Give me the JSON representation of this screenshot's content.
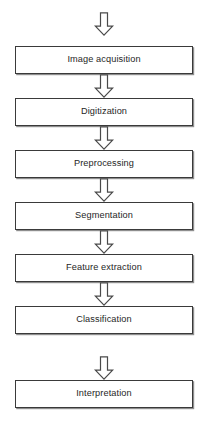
{
  "diagram": {
    "type": "flowchart",
    "orientation": "vertical",
    "title": "",
    "background_color": "#ffffff",
    "box_border_color": "#3a3a3a",
    "box_fill_color": "#ffffff",
    "box_shadow_color": "#8e8e8e",
    "text_color": "#262626",
    "arrow_style": "open-block-arrow",
    "arrow_fill_color": "#ffffff",
    "arrow_border_color": "#4a4a4a",
    "stages": [
      {
        "label": "Image acquisition",
        "box_top": 46,
        "arrow_top": 12
      },
      {
        "label": "Digitization",
        "box_top": 98,
        "arrow_top": 74
      },
      {
        "label": "Preprocessing",
        "box_top": 150,
        "arrow_top": 126
      },
      {
        "label": "Segmentation",
        "box_top": 202,
        "arrow_top": 178
      },
      {
        "label": "Feature extraction",
        "box_top": 254,
        "arrow_top": 230
      },
      {
        "label": "Classification",
        "box_top": 306,
        "arrow_top": 282
      },
      {
        "label": "Interpretation",
        "box_top": 380,
        "arrow_top": 356
      }
    ]
  },
  "footer": {
    "caption_fragment": ""
  }
}
